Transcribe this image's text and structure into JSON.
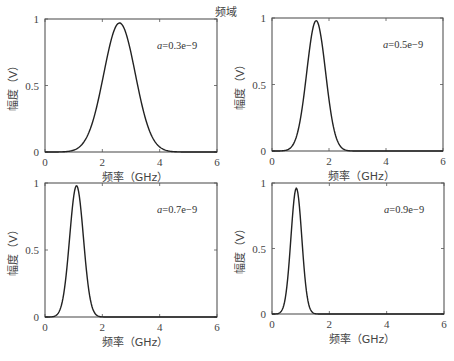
{
  "figure_title": "频域",
  "chart_data": [
    {
      "type": "line",
      "title": "",
      "annotation": "a=0.3e-9",
      "xlabel": "频率（GHz）",
      "ylabel": "幅度（V）",
      "xlim": [
        0,
        6
      ],
      "ylim": [
        0,
        1
      ],
      "xticks": [
        0,
        2,
        4,
        6
      ],
      "yticks": [
        0,
        0.5,
        1
      ],
      "grid": false,
      "series": [
        {
          "name": "a=0.3e-9",
          "peak_x": 2.6,
          "peak_y": 0.97,
          "sigma": 0.55,
          "x": [
            0,
            0.8,
            1.2,
            1.6,
            2.0,
            2.3,
            2.6,
            2.9,
            3.2,
            3.6,
            4.0,
            4.4,
            6
          ],
          "y": [
            0,
            0.01,
            0.07,
            0.26,
            0.58,
            0.83,
            0.97,
            0.85,
            0.58,
            0.24,
            0.06,
            0.01,
            0
          ]
        }
      ]
    },
    {
      "type": "line",
      "title": "",
      "annotation": "a=0.5e-9",
      "xlabel": "频率（GHz）",
      "ylabel": "幅度（V）",
      "xlim": [
        0,
        6
      ],
      "ylim": [
        0,
        1
      ],
      "xticks": [
        0,
        2,
        4,
        6
      ],
      "yticks": [
        0,
        0.5,
        1
      ],
      "grid": false,
      "series": [
        {
          "name": "a=0.5e-9",
          "peak_x": 1.55,
          "peak_y": 0.98,
          "sigma": 0.33,
          "x": [
            0,
            0.5,
            0.8,
            1.0,
            1.2,
            1.4,
            1.55,
            1.7,
            1.9,
            2.1,
            2.4,
            2.7,
            6
          ],
          "y": [
            0,
            0.01,
            0.08,
            0.25,
            0.55,
            0.87,
            0.98,
            0.88,
            0.56,
            0.25,
            0.04,
            0,
            0
          ]
        }
      ]
    },
    {
      "type": "line",
      "title": "",
      "annotation": "a=0.7e-9",
      "xlabel": "频率（GHz）",
      "ylabel": "幅度（V）",
      "xlim": [
        0,
        6
      ],
      "ylim": [
        0,
        1
      ],
      "xticks": [
        0,
        2,
        4,
        6
      ],
      "yticks": [
        0,
        0.5,
        1
      ],
      "grid": false,
      "series": [
        {
          "name": "a=0.7e-9",
          "peak_x": 1.1,
          "peak_y": 0.98,
          "sigma": 0.24,
          "x": [
            0,
            0.4,
            0.6,
            0.8,
            0.95,
            1.1,
            1.25,
            1.4,
            1.6,
            1.8,
            2.0,
            6
          ],
          "y": [
            0,
            0.01,
            0.1,
            0.42,
            0.8,
            0.98,
            0.84,
            0.48,
            0.11,
            0.01,
            0,
            0
          ]
        }
      ]
    },
    {
      "type": "line",
      "title": "",
      "annotation": "a=0.9e-9",
      "xlabel": "频率（GHz）",
      "ylabel": "幅度（V）",
      "xlim": [
        0,
        6
      ],
      "ylim": [
        0,
        1
      ],
      "xticks": [
        0,
        2,
        4,
        6
      ],
      "yticks": [
        0,
        0.5,
        1
      ],
      "grid": false,
      "series": [
        {
          "name": "a=0.9e-9",
          "peak_x": 0.85,
          "peak_y": 0.96,
          "sigma": 0.19,
          "x": [
            0,
            0.3,
            0.45,
            0.6,
            0.75,
            0.85,
            0.95,
            1.1,
            1.25,
            1.4,
            1.6,
            6
          ],
          "y": [
            0,
            0.01,
            0.11,
            0.42,
            0.84,
            0.96,
            0.84,
            0.42,
            0.1,
            0.01,
            0,
            0
          ]
        }
      ]
    }
  ],
  "panels": [
    {
      "annotation": "a=0.3e-9",
      "ann_var": "a",
      "ann_rest": "=0.3e−9",
      "xlabel": "频率（GHz）",
      "ylabel": "幅度（V）"
    },
    {
      "annotation": "a=0.5e-9",
      "ann_var": "a",
      "ann_rest": "=0.5e−9",
      "xlabel": "频率（GHz）",
      "ylabel": "幅度（V）"
    },
    {
      "annotation": "a=0.7e-9",
      "ann_var": "a",
      "ann_rest": "=0.7e−9",
      "xlabel": "频率（GHz）",
      "ylabel": "幅度（V）"
    },
    {
      "annotation": "a=0.9e-9",
      "ann_var": "a",
      "ann_rest": "=0.9e−9",
      "xlabel": "频率（GHz）",
      "ylabel": "幅度（V）"
    }
  ],
  "tick_labels": {
    "x": [
      "0",
      "2",
      "4",
      "6"
    ],
    "y": [
      "0",
      "0.5",
      "1"
    ]
  },
  "line_color": "#222222",
  "axis_color": "#555555"
}
